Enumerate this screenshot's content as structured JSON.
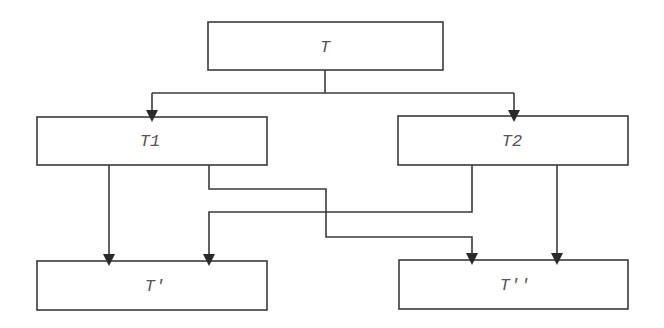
{
  "diagram": {
    "type": "flow",
    "nodes": [
      {
        "id": "T",
        "label": "T"
      },
      {
        "id": "T1",
        "label": "T1"
      },
      {
        "id": "T2",
        "label": "T2"
      },
      {
        "id": "Tprime",
        "label": "T'"
      },
      {
        "id": "Tdoubleprime",
        "label": "T''"
      }
    ],
    "edges": [
      {
        "from": "T",
        "to": "T1"
      },
      {
        "from": "T",
        "to": "T2"
      },
      {
        "from": "T1",
        "to": "T'"
      },
      {
        "from": "T1",
        "to": "T''"
      },
      {
        "from": "T2",
        "to": "T'"
      },
      {
        "from": "T2",
        "to": "T''"
      }
    ],
    "colors": {
      "stroke": "#3a3a3a",
      "arrow": "#2a2a2a",
      "text": "#555555",
      "background": "#ffffff"
    }
  }
}
